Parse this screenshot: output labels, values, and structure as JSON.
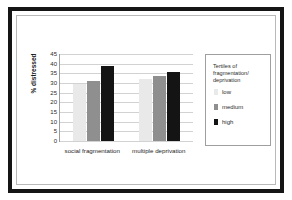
{
  "chart_data": {
    "type": "bar",
    "title": "",
    "xlabel": "",
    "ylabel": "% distressed",
    "ylim": [
      0,
      45
    ],
    "yticks": [
      45,
      40,
      35,
      30,
      25,
      20,
      15,
      10,
      5,
      0
    ],
    "grid": true,
    "legend_position": "right",
    "legend_title": "Tertiles of fragmentation/ deprivation",
    "categories": [
      "social fragmentation",
      "multiple deprivation"
    ],
    "series": [
      {
        "name": "low",
        "color": "#e9e9e9",
        "values": [
          29.5,
          32.0
        ]
      },
      {
        "name": "medium",
        "color": "#8f8f8f",
        "values": [
          31.0,
          33.5
        ]
      },
      {
        "name": "high",
        "color": "#141414",
        "values": [
          39.0,
          35.5
        ]
      }
    ]
  }
}
